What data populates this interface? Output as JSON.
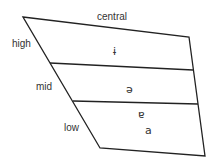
{
  "diagram": {
    "title": "central",
    "row_labels": {
      "high": "high",
      "mid": "mid",
      "low": "low"
    },
    "vowels": {
      "high_central": "ɨ",
      "mid_central": "ə",
      "near_low_central": "ɐ",
      "low_central": "a"
    },
    "colors": {
      "line": "#222222",
      "text": "#333333",
      "background": "#ffffff"
    }
  }
}
